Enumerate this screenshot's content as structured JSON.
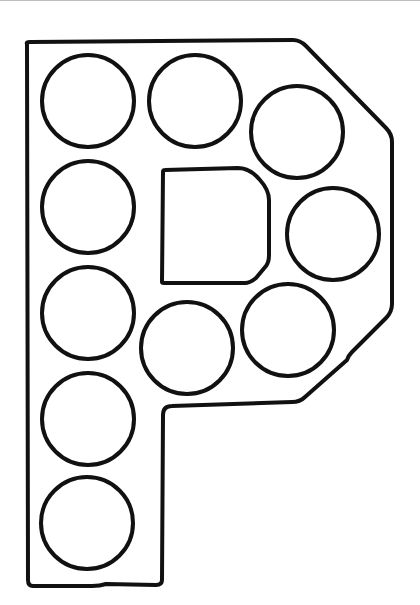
{
  "page": {
    "letter": "P"
  },
  "colors": {
    "stroke": "#111111",
    "background": "#ffffff"
  },
  "letter_outline": {
    "stroke_width": 4,
    "outer_path": "M 27 44 Q 26 42 30 42 L 293 40 Q 300 40 306 46 L 386 128 Q 392 134 392 142 L 392 304 Q 392 312 386 318 L 352 352 Q 348 356 347 360 L 305 397 Q 300 402 292 402 L 172 406 Q 163 406 163 415 L 162 580 Q 162 585 156 585 L 106 584 Q 100 586 92 586 L 33 586 Q 28 586 28 580 Z",
    "counter_path": "M 165 170 Q 163 170 163 172 L 162 282 Q 162 283 164 283 L 245 283 Q 250 283 256 278 L 266 266 Q 269 262 269 255 L 269 200 Q 269 190 260 180 Q 250 168 238 168 Z"
  },
  "dots": [
    {
      "id": 1,
      "cx": 88,
      "cy": 101,
      "r": 46
    },
    {
      "id": 2,
      "cx": 195,
      "cy": 101,
      "r": 46
    },
    {
      "id": 3,
      "cx": 297,
      "cy": 132,
      "r": 46
    },
    {
      "id": 4,
      "cx": 88,
      "cy": 207,
      "r": 46
    },
    {
      "id": 5,
      "cx": 333,
      "cy": 234,
      "r": 46
    },
    {
      "id": 6,
      "cx": 88,
      "cy": 313,
      "r": 46
    },
    {
      "id": 7,
      "cx": 187,
      "cy": 348,
      "r": 46
    },
    {
      "id": 8,
      "cx": 288,
      "cy": 330,
      "r": 46
    },
    {
      "id": 9,
      "cx": 88,
      "cy": 419,
      "r": 46
    },
    {
      "id": 10,
      "cx": 87,
      "cy": 523,
      "r": 46
    }
  ]
}
